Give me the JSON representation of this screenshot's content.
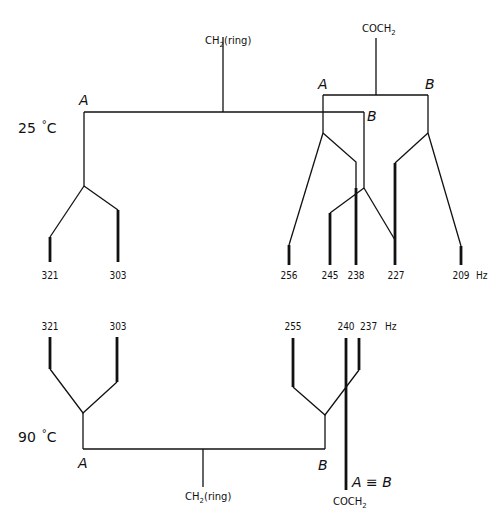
{
  "unit": "Hz",
  "top_diagram": {
    "temperature": "25 °C",
    "temperature_value": "25",
    "temperature_unit": "°C",
    "groups": [
      {
        "name": "CH2(ring)",
        "label_main": "CH",
        "label_sub": "2",
        "label_suffix": "(ring)",
        "sites": [
          "A",
          "B"
        ]
      },
      {
        "name": "COCH2",
        "label_main": "COCH",
        "label_sub": "2",
        "label_suffix": "",
        "sites": [
          "A",
          "B"
        ]
      }
    ],
    "site_labels": {
      "ring_A": "A",
      "ring_B": "B",
      "coch2_A": "A",
      "coch2_B": "B"
    },
    "lines_hz": [
      "321",
      "303",
      "256",
      "245",
      "238",
      "227",
      "209"
    ],
    "hz_label": "Hz"
  },
  "bottom_diagram": {
    "temperature": "90 °C",
    "temperature_value": "90",
    "temperature_unit": "°C",
    "groups": [
      {
        "name": "CH2(ring)",
        "label_main": "CH",
        "label_sub": "2",
        "label_suffix": "(ring)",
        "sites": [
          "A",
          "B"
        ]
      },
      {
        "name": "COCH2",
        "label_main": "COCH",
        "label_sub": "2",
        "label_suffix": "",
        "sites": [
          "A ≡ B"
        ]
      }
    ],
    "site_labels": {
      "ring_A": "A",
      "ring_B": "B",
      "coch2_AB": "A ≡ B"
    },
    "lines_hz": [
      "321",
      "303",
      "255",
      "240",
      "237"
    ],
    "hz_label": "Hz"
  }
}
